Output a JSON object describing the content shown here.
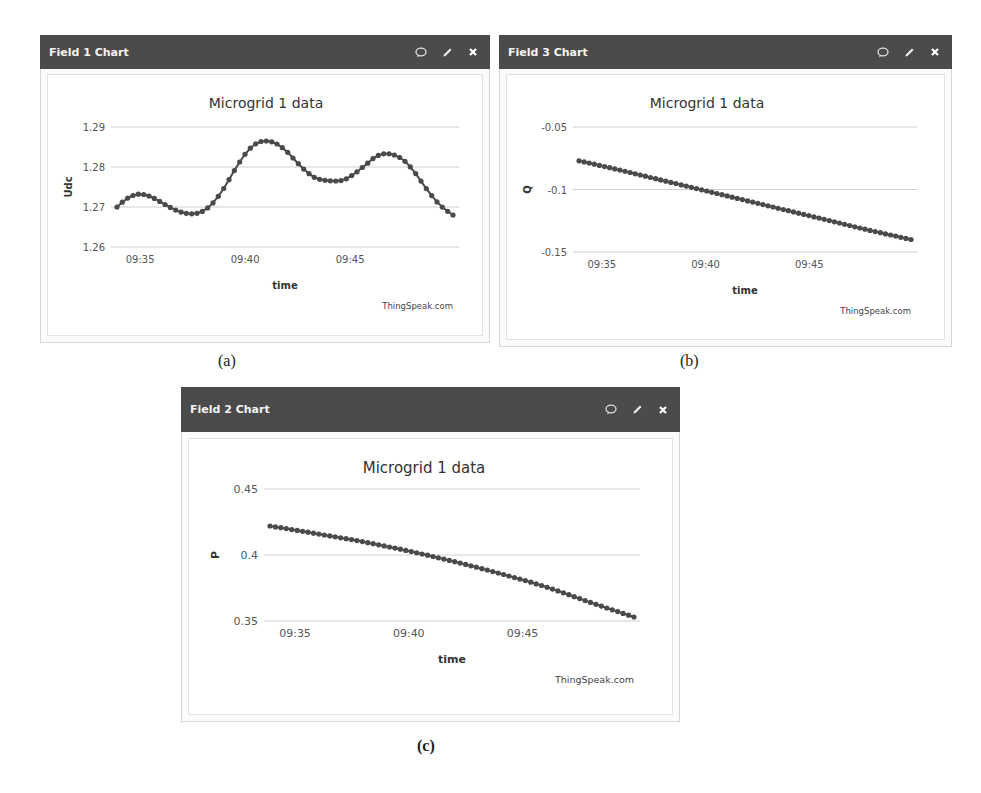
{
  "panels": [
    {
      "id": "a",
      "header_title": "Field 1 Chart",
      "icons": [
        "comment-icon",
        "pencil-icon",
        "close-icon"
      ],
      "chart_title": "Microgrid 1 data",
      "y_label": "Udc",
      "x_label": "time",
      "credit": "ThingSpeak.com",
      "caption": "(a)"
    },
    {
      "id": "b",
      "header_title": "Field 3 Chart",
      "icons": [
        "comment-icon",
        "pencil-icon",
        "close-icon"
      ],
      "chart_title": "Microgrid 1 data",
      "y_label": "Q",
      "x_label": "time",
      "credit": "ThingSpeak.com",
      "caption": "(b)"
    },
    {
      "id": "c",
      "header_title": "Field 2 Chart",
      "icons": [
        "comment-icon",
        "pencil-icon",
        "close-icon"
      ],
      "chart_title": "Microgrid 1 data",
      "y_label": "P",
      "x_label": "time",
      "credit": "ThingSpeak.com",
      "caption": "(c)"
    }
  ],
  "colors": {
    "header_bg": "#4b4b4b",
    "header_text": "#f4f4f4",
    "series": "#4a4a4a",
    "grid": "#cfcfcf",
    "axis_text": "#555555"
  },
  "chart_data": [
    {
      "type": "line",
      "title": "Microgrid 1 data",
      "panel": "Field 1 Chart",
      "xlabel": "time",
      "ylabel": "Udc",
      "x_ticks": [
        "09:35",
        "09:40",
        "09:45"
      ],
      "y_ticks": [
        1.26,
        1.27,
        1.28,
        1.29
      ],
      "ylim": [
        1.26,
        1.29
      ],
      "xlim": [
        "09:33.9",
        "09:49.9"
      ],
      "grid": true,
      "legend": "none",
      "markers": true,
      "series": [
        {
          "name": "Udc",
          "x_minutes": [
            33.9,
            34.4,
            34.9,
            35.4,
            35.9,
            36.4,
            36.9,
            37.5,
            38.0,
            38.5,
            39.0,
            39.5,
            40.0,
            40.5,
            41.0,
            41.5,
            42.0,
            42.5,
            43.0,
            43.5,
            44.3,
            44.8,
            45.3,
            45.8,
            46.2,
            46.6,
            47.1,
            47.6,
            48.1,
            48.6,
            49.1,
            49.5,
            49.9
          ],
          "values": [
            1.27,
            1.2722,
            1.2732,
            1.2728,
            1.2715,
            1.27,
            1.2688,
            1.2683,
            1.269,
            1.2712,
            1.2748,
            1.2792,
            1.2832,
            1.2858,
            1.2865,
            1.2858,
            1.2838,
            1.281,
            1.2785,
            1.277,
            1.2765,
            1.277,
            1.2787,
            1.2808,
            1.2825,
            1.2833,
            1.283,
            1.2815,
            1.2785,
            1.2748,
            1.2715,
            1.2695,
            1.268
          ]
        }
      ]
    },
    {
      "type": "line",
      "title": "Microgrid 1 data",
      "panel": "Field 3 Chart",
      "xlabel": "time",
      "ylabel": "Q",
      "x_ticks": [
        "09:35",
        "09:40",
        "09:45"
      ],
      "y_ticks": [
        -0.05,
        -0.1,
        -0.15
      ],
      "ylim": [
        -0.15,
        -0.05
      ],
      "xlim": [
        "09:33.9",
        "09:49.9"
      ],
      "grid": true,
      "legend": "none",
      "markers": true,
      "series": [
        {
          "name": "Q",
          "x_minutes": [
            33.9,
            36.0,
            38.0,
            40.0,
            42.0,
            44.0,
            46.0,
            48.0,
            49.9
          ],
          "values": [
            -0.077,
            -0.085,
            -0.093,
            -0.101,
            -0.109,
            -0.117,
            -0.125,
            -0.133,
            -0.14
          ]
        }
      ]
    },
    {
      "type": "line",
      "title": "Microgrid 1 data",
      "panel": "Field 2 Chart",
      "xlabel": "time",
      "ylabel": "P",
      "x_ticks": [
        "09:35",
        "09:40",
        "09:45"
      ],
      "y_ticks": [
        0.35,
        0.4,
        0.45
      ],
      "ylim": [
        0.35,
        0.45
      ],
      "xlim": [
        "09:33.9",
        "09:49.9"
      ],
      "grid": true,
      "legend": "none",
      "markers": true,
      "series": [
        {
          "name": "P",
          "x_minutes": [
            33.9,
            36.0,
            38.0,
            40.0,
            42.0,
            44.0,
            46.0,
            48.0,
            49.9
          ],
          "values": [
            0.422,
            0.416,
            0.41,
            0.403,
            0.395,
            0.386,
            0.376,
            0.364,
            0.353
          ]
        }
      ]
    }
  ]
}
